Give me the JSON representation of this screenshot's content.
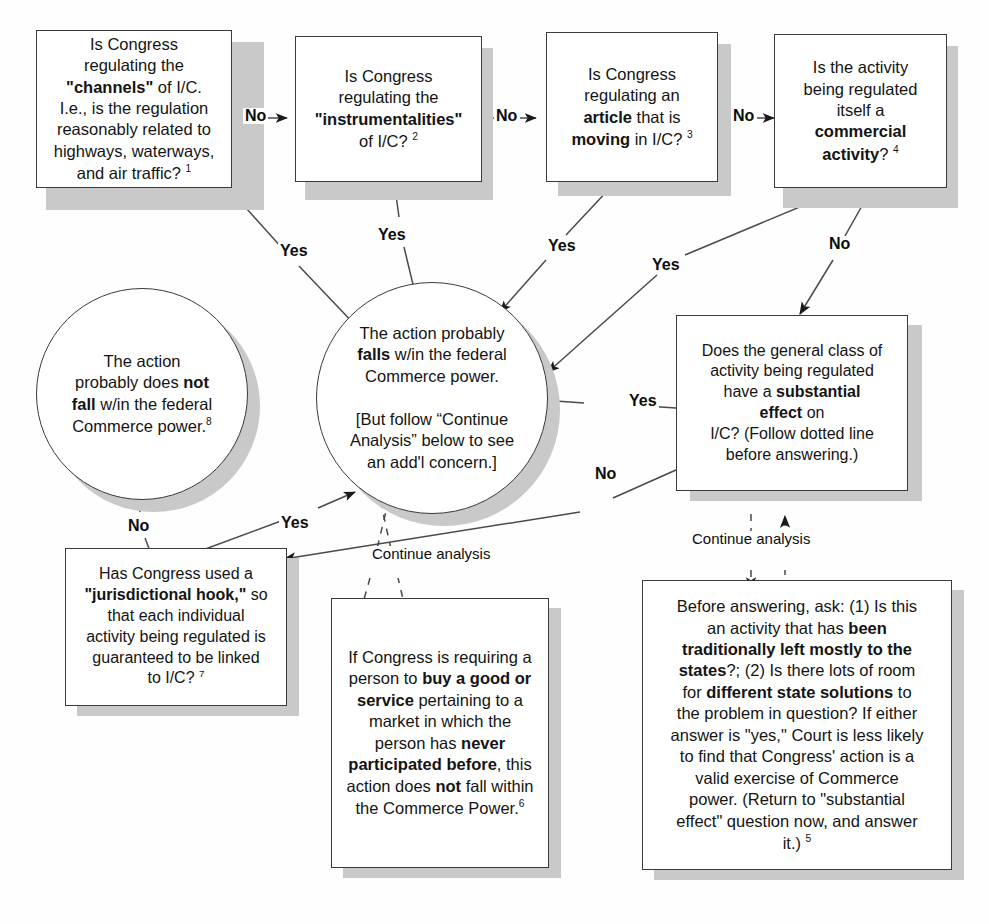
{
  "diagram": {
    "nodes": {
      "q1_channels": {
        "id": "q1",
        "shape": "rect",
        "lines": [
          {
            "runs": [
              {
                "t": "Is Congress",
                "b": false
              }
            ]
          },
          {
            "runs": [
              {
                "t": "regulating the",
                "b": false
              }
            ]
          },
          {
            "runs": [
              {
                "t": "\"channels\"",
                "b": true
              },
              {
                "t": " of I/C.",
                "b": false
              }
            ]
          },
          {
            "runs": [
              {
                "t": "I.e., is the regulation",
                "b": false
              }
            ]
          },
          {
            "runs": [
              {
                "t": "reasonably related to",
                "b": false
              }
            ]
          },
          {
            "runs": [
              {
                "t": "highways, waterways,",
                "b": false
              }
            ]
          },
          {
            "runs": [
              {
                "t": "and air traffic? ",
                "b": false
              },
              {
                "t": "1",
                "b": false,
                "sup": true
              }
            ]
          }
        ]
      },
      "q2_instrumentalities": {
        "id": "q2",
        "shape": "rect",
        "lines": [
          {
            "runs": [
              {
                "t": "Is Congress",
                "b": false
              }
            ]
          },
          {
            "runs": [
              {
                "t": "regulating the",
                "b": false
              }
            ]
          },
          {
            "runs": [
              {
                "t": "\"instrumentalities\"",
                "b": true
              }
            ]
          },
          {
            "runs": [
              {
                "t": "of I/C? ",
                "b": false
              },
              {
                "t": "2",
                "b": false,
                "sup": true
              }
            ]
          }
        ]
      },
      "q3_article_moving": {
        "id": "q3",
        "shape": "rect",
        "lines": [
          {
            "runs": [
              {
                "t": "Is Congress",
                "b": false
              }
            ]
          },
          {
            "runs": [
              {
                "t": "regulating an",
                "b": false
              }
            ]
          },
          {
            "runs": [
              {
                "t": "article",
                "b": true
              },
              {
                "t": " that is",
                "b": false
              }
            ]
          },
          {
            "runs": [
              {
                "t": "moving",
                "b": true
              },
              {
                "t": " in I/C? ",
                "b": false
              },
              {
                "t": "3",
                "b": false,
                "sup": true
              }
            ]
          }
        ]
      },
      "q4_commercial_activity": {
        "id": "q4",
        "shape": "rect",
        "lines": [
          {
            "runs": [
              {
                "t": "Is the activity",
                "b": false
              }
            ]
          },
          {
            "runs": [
              {
                "t": "being regulated",
                "b": false
              }
            ]
          },
          {
            "runs": [
              {
                "t": "itself a",
                "b": false
              }
            ]
          },
          {
            "runs": [
              {
                "t": "commercial",
                "b": true
              }
            ]
          },
          {
            "runs": [
              {
                "t": "activity",
                "b": true
              },
              {
                "t": "? ",
                "b": false
              },
              {
                "t": "4",
                "b": false,
                "sup": true
              }
            ]
          }
        ]
      },
      "outcome_falls_within": {
        "id": "falls",
        "shape": "ellipse",
        "lines": [
          {
            "runs": [
              {
                "t": "The action probably",
                "b": false
              }
            ]
          },
          {
            "runs": [
              {
                "t": "falls",
                "b": true
              },
              {
                "t": " w/in the federal",
                "b": false
              }
            ]
          },
          {
            "runs": [
              {
                "t": "Commerce power.",
                "b": false
              }
            ]
          },
          {
            "runs": [
              {
                "t": "",
                "b": false
              }
            ]
          },
          {
            "runs": [
              {
                "t": "[But follow “Continue",
                "b": false
              }
            ]
          },
          {
            "runs": [
              {
                "t": "Analysis”  below to see",
                "b": false
              }
            ]
          },
          {
            "runs": [
              {
                "t": "an add'l concern.]",
                "b": false
              }
            ]
          }
        ]
      },
      "outcome_does_not_fall": {
        "id": "notfall",
        "shape": "ellipse",
        "lines": [
          {
            "runs": [
              {
                "t": "The action",
                "b": false
              }
            ]
          },
          {
            "runs": [
              {
                "t": "probably does ",
                "b": false
              },
              {
                "t": "not",
                "b": true
              }
            ]
          },
          {
            "runs": [
              {
                "t": "fall",
                "b": true
              },
              {
                "t": " w/in the federal",
                "b": false
              }
            ]
          },
          {
            "runs": [
              {
                "t": "Commerce power.",
                "b": false
              },
              {
                "t": "8",
                "b": false,
                "sup": true
              }
            ]
          }
        ]
      },
      "q5_substantial_effect": {
        "id": "subst",
        "shape": "rect",
        "lines": [
          {
            "runs": [
              {
                "t": "Does the general class of",
                "b": false
              }
            ]
          },
          {
            "runs": [
              {
                "t": "activity being regulated",
                "b": false
              }
            ]
          },
          {
            "runs": [
              {
                "t": "have a ",
                "b": false
              },
              {
                "t": "substantial",
                "b": true
              }
            ]
          },
          {
            "runs": [
              {
                "t": "effect",
                "b": true
              },
              {
                "t": " on",
                "b": false
              }
            ]
          },
          {
            "runs": [
              {
                "t": "I/C? (Follow dotted line",
                "b": false
              }
            ]
          },
          {
            "runs": [
              {
                "t": "before answering.)",
                "b": false
              }
            ]
          }
        ]
      },
      "q6_jurisdictional_hook": {
        "id": "hook",
        "shape": "rect",
        "lines": [
          {
            "runs": [
              {
                "t": "Has Congress used a",
                "b": false
              }
            ]
          },
          {
            "runs": [
              {
                "t": "\"jurisdictional hook,\"",
                "b": true
              },
              {
                "t": " so",
                "b": false
              }
            ]
          },
          {
            "runs": [
              {
                "t": "that each individual",
                "b": false
              }
            ]
          },
          {
            "runs": [
              {
                "t": "activity being regulated is",
                "b": false
              }
            ]
          },
          {
            "runs": [
              {
                "t": "guaranteed to be linked",
                "b": false
              }
            ]
          },
          {
            "runs": [
              {
                "t": "to I/C? ",
                "b": false
              },
              {
                "t": "7",
                "b": false,
                "sup": true
              }
            ]
          }
        ]
      },
      "note_buy_good_or_service": {
        "id": "buygood",
        "shape": "rect",
        "lines": [
          {
            "runs": [
              {
                "t": "If Congress is requiring a",
                "b": false
              }
            ]
          },
          {
            "runs": [
              {
                "t": "person to ",
                "b": false
              },
              {
                "t": "buy a good or",
                "b": true
              }
            ]
          },
          {
            "runs": [
              {
                "t": "service",
                "b": true
              },
              {
                "t": " pertaining to a",
                "b": false
              }
            ]
          },
          {
            "runs": [
              {
                "t": "market in which the",
                "b": false
              }
            ]
          },
          {
            "runs": [
              {
                "t": "person has ",
                "b": false
              },
              {
                "t": "never",
                "b": true
              }
            ]
          },
          {
            "runs": [
              {
                "t": "participated before",
                "b": true
              },
              {
                "t": ", this",
                "b": false
              }
            ]
          },
          {
            "runs": [
              {
                "t": "action does ",
                "b": false
              },
              {
                "t": "not",
                "b": true
              },
              {
                "t": " fall within",
                "b": false
              }
            ]
          },
          {
            "runs": [
              {
                "t": "the Commerce Power.",
                "b": false
              },
              {
                "t": "6",
                "b": false,
                "sup": true
              }
            ]
          }
        ]
      },
      "note_before_answering": {
        "id": "before",
        "shape": "rect",
        "lines": [
          {
            "runs": [
              {
                "t": "Before answering, ask: (1) Is this",
                "b": false
              }
            ]
          },
          {
            "runs": [
              {
                "t": "an activity that has ",
                "b": false
              },
              {
                "t": "been",
                "b": true
              }
            ]
          },
          {
            "runs": [
              {
                "t": "traditionally left mostly to the",
                "b": true
              }
            ]
          },
          {
            "runs": [
              {
                "t": "states",
                "b": true
              },
              {
                "t": "?; (2) Is there lots of room",
                "b": false
              }
            ]
          },
          {
            "runs": [
              {
                "t": "for ",
                "b": false
              },
              {
                "t": "different state solutions",
                "b": true
              },
              {
                "t": " to",
                "b": false
              }
            ]
          },
          {
            "runs": [
              {
                "t": "the problem in question? If either",
                "b": false
              }
            ]
          },
          {
            "runs": [
              {
                "t": "answer is \"yes,\" Court is less likely",
                "b": false
              }
            ]
          },
          {
            "runs": [
              {
                "t": "to find that Congress' action is a",
                "b": false
              }
            ]
          },
          {
            "runs": [
              {
                "t": "valid exercise of Commerce",
                "b": false
              }
            ]
          },
          {
            "runs": [
              {
                "t": "power. (Return to \"substantial",
                "b": false
              }
            ]
          },
          {
            "runs": [
              {
                "t": "effect\" question now, and answer",
                "b": false
              }
            ]
          },
          {
            "runs": [
              {
                "t": "it.) ",
                "b": false
              },
              {
                "t": "5",
                "b": false,
                "sup": true
              }
            ]
          }
        ]
      }
    },
    "edge_labels": {
      "no_q1_q2": "No",
      "no_q2_q3": "No",
      "no_q3_q4": "No",
      "yes_q1_falls": "Yes",
      "yes_q2_falls": "Yes",
      "yes_q3_falls": "Yes",
      "yes_q4_falls": "Yes",
      "no_q4_subst": "No",
      "yes_subst_falls": "Yes",
      "no_subst_hook": "No",
      "yes_hook_falls": "Yes",
      "no_hook_notfall": "No",
      "continue_analysis_center": "Continue analysis",
      "continue_analysis_right": "Continue analysis"
    },
    "colors": {
      "ink": "#141414",
      "border": "#3a3a3a",
      "shadow": "#c9c9c9",
      "paper": "#fefefe"
    }
  }
}
